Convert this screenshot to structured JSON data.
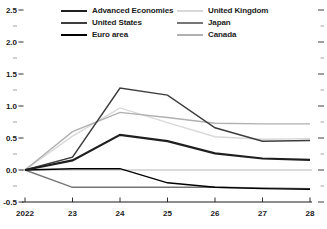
{
  "chart_data": {
    "type": "line",
    "title": "",
    "xlabel": "",
    "ylabel": "",
    "x": [
      2022,
      2023,
      2024,
      2025,
      2026,
      2027,
      2028
    ],
    "x_tick_labels": [
      "2022",
      "23",
      "24",
      "25",
      "26",
      "27",
      "28"
    ],
    "y_ticks": [
      -0.5,
      0.0,
      0.5,
      1.0,
      1.5,
      2.0,
      2.5
    ],
    "y_tick_labels": [
      "-0.5",
      "0.0",
      "0.5",
      "1.0",
      "1.5",
      "2.0",
      "2.5"
    ],
    "y_minor_ticks": [
      -0.25,
      0.25,
      0.75,
      1.25,
      1.75,
      2.25
    ],
    "ylim": [
      -0.5,
      2.5
    ],
    "grid": "zero-line-only",
    "legend_position": "top-inside-two-columns",
    "axis_color": "#1a1a1a",
    "zero_line_color": "#9a9a9a",
    "series": [
      {
        "name": "Advanced Economies",
        "color": "#1f1f1f",
        "width": 2.2,
        "values": [
          0.0,
          0.15,
          0.55,
          0.45,
          0.26,
          0.18,
          0.16
        ]
      },
      {
        "name": "United States",
        "color": "#3d3d3d",
        "width": 1.5,
        "values": [
          0.0,
          0.2,
          1.28,
          1.17,
          0.66,
          0.45,
          0.46
        ]
      },
      {
        "name": "Euro area",
        "color": "#000000",
        "width": 1.4,
        "values": [
          0.0,
          0.02,
          0.02,
          -0.2,
          -0.27,
          -0.29,
          -0.3
        ]
      },
      {
        "name": "United Kingdom",
        "color": "#d8d8d8",
        "width": 1.4,
        "values": [
          0.0,
          0.53,
          0.97,
          0.74,
          0.52,
          0.48,
          0.49
        ]
      },
      {
        "name": "Japan",
        "color": "#767676",
        "width": 1.4,
        "values": [
          0.0,
          -0.27,
          -0.27,
          -0.27,
          -0.27,
          -0.28,
          -0.29
        ]
      },
      {
        "name": "Canada",
        "color": "#b0b0b0",
        "width": 1.4,
        "values": [
          0.0,
          0.6,
          0.9,
          0.82,
          0.73,
          0.72,
          0.72
        ]
      }
    ]
  }
}
